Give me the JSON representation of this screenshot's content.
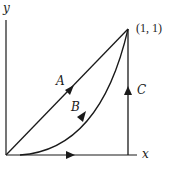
{
  "diagram": {
    "title": "",
    "axes": {
      "x_label": "x",
      "y_label": "y"
    },
    "endpoint_label": "(1, 1)",
    "paths": [
      {
        "id": "A",
        "label": "A",
        "description": "straight line from (0,0) to (1,1)"
      },
      {
        "id": "B",
        "label": "B",
        "description": "curve from (0,0) to (1,1)"
      },
      {
        "id": "C",
        "label": "C",
        "description": "along x-axis from (0,0) to (1,0), then vertically to (1,1)"
      }
    ],
    "colors": {
      "stroke": "#1a1a1a",
      "background": "#ffffff"
    }
  }
}
